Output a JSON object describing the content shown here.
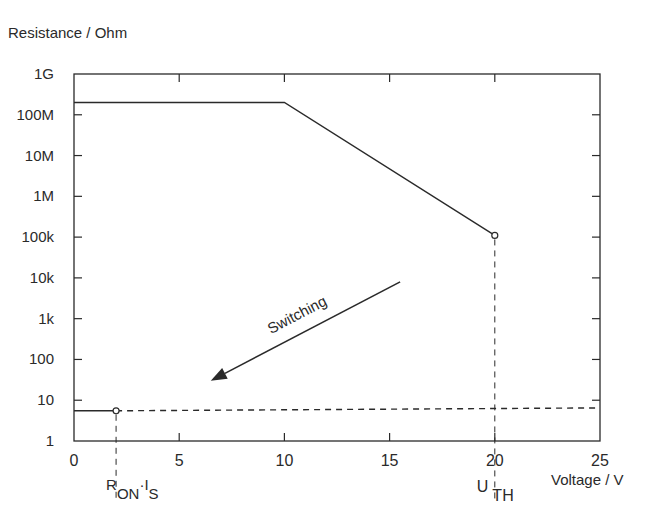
{
  "chart_data": {
    "type": "line",
    "title": "",
    "ylabel": "Resistance / Ohm",
    "xlabel": "Voltage / V",
    "xscale": "linear",
    "yscale": "log",
    "xlim": [
      0,
      25
    ],
    "ylim": [
      1,
      1000000000
    ],
    "x_ticks": [
      0,
      5,
      10,
      15,
      20,
      25
    ],
    "x_tick_labels": [
      "0",
      "5",
      "10",
      "15",
      "20",
      "25"
    ],
    "y_ticks": [
      1,
      10,
      100,
      1000,
      10000,
      100000,
      1000000,
      10000000,
      100000000,
      1000000000
    ],
    "y_tick_labels": [
      "1",
      "10",
      "100",
      "1k",
      "10k",
      "100k",
      "1M",
      "10M",
      "100M",
      "1G"
    ],
    "grid": false,
    "series": [
      {
        "name": "off-state resistance",
        "style": "solid",
        "points": [
          [
            0,
            200000000
          ],
          [
            10,
            200000000
          ],
          [
            20,
            110000
          ]
        ]
      },
      {
        "name": "on-state resistance",
        "style": "solid",
        "points": [
          [
            0,
            5.5
          ],
          [
            2,
            5.5
          ]
        ]
      },
      {
        "name": "on-state extension",
        "style": "dashed",
        "points": [
          [
            2,
            5.5
          ],
          [
            25,
            6.5
          ]
        ]
      }
    ],
    "markers": [
      {
        "name": "threshold-point",
        "x": 20,
        "y": 110000,
        "shape": "open-circle"
      },
      {
        "name": "on-point",
        "x": 2,
        "y": 5.5,
        "shape": "open-circle"
      }
    ],
    "guides": [
      {
        "name": "threshold-guide",
        "x": 20,
        "from_y": 110000,
        "label_main": "U",
        "label_sub": "TH"
      },
      {
        "name": "on-guide",
        "x": 2,
        "from_y": 5.5,
        "label_main": "R",
        "label_sub1": "ON",
        "label_dot": "·",
        "label_main2": "I",
        "label_sub2": "S"
      }
    ],
    "annotations": [
      {
        "name": "switching-arrow",
        "text": "Switching",
        "from": [
          15.5,
          8000
        ],
        "to": [
          6.5,
          30
        ]
      }
    ]
  }
}
